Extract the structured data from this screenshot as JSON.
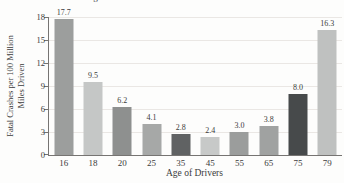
{
  "figure": {
    "background": "#fdfdfc",
    "text_color": "#3b3b3b",
    "axis_color": "#767472",
    "gridline_color": "#eae7e4"
  },
  "chart_data": {
    "type": "bar",
    "title": "Age of United States Drivers and Fatal Crashes",
    "categories": [
      "16",
      "18",
      "20",
      "25",
      "35",
      "45",
      "55",
      "65",
      "75",
      "79"
    ],
    "values": [
      17.7,
      9.5,
      6.2,
      4.1,
      2.8,
      2.4,
      3.0,
      3.8,
      8.0,
      16.3
    ],
    "value_labels": [
      "17.7",
      "9.5",
      "6.2",
      "4.1",
      "2.8",
      "2.4",
      "3.0",
      "3.8",
      "8.0",
      "16.3"
    ],
    "bar_colors": [
      "#9c9e9d",
      "#c5c7c6",
      "#8e908f",
      "#a6a8a7",
      "#606263",
      "#c7c9c8",
      "#9b9d9c",
      "#a0a2a1",
      "#474a4b",
      "#bfc1c0"
    ],
    "xlabel": "Age of Drivers",
    "ylabel": "Fatal Crashes per 100 Million Miles Driven",
    "ylabel_lines": [
      "Fatal Crashes per 100 Million",
      "Miles Driven"
    ],
    "ylim": [
      0,
      18
    ],
    "yticks": [
      0,
      3,
      6,
      9,
      12,
      15,
      18
    ],
    "grid": true,
    "legend": false
  }
}
